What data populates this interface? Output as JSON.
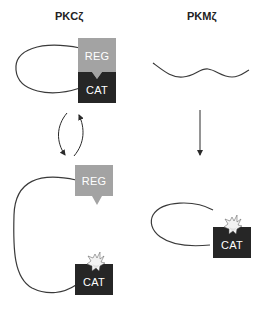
{
  "diagram": {
    "left_panel": {
      "title": "PKCζ",
      "state_top": {
        "reg_label": "REG",
        "cat_label": "CAT",
        "description": "REG bound to CAT (inactive)"
      },
      "state_bottom": {
        "reg_label": "REG",
        "cat_label": "CAT",
        "description": "REG released, CAT active"
      },
      "transition": "reversible"
    },
    "right_panel": {
      "title": "PKMζ",
      "state_top": {
        "description": "unfolded chain"
      },
      "state_bottom": {
        "cat_label": "CAT",
        "description": "CAT active"
      },
      "transition": "one-way"
    },
    "colors": {
      "reg": "#a3a3a3",
      "cat": "#262626",
      "line": "#3a3a3a",
      "starburst": "#f2f2f2"
    }
  }
}
